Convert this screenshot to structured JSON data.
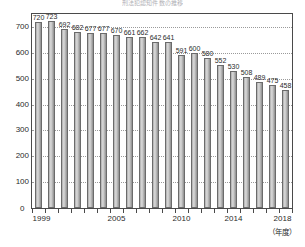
{
  "chart_data": {
    "type": "bar",
    "title": "刑法犯認知件数の推移",
    "xlabel": "（年度）",
    "ylabel": "",
    "categories": [
      "1999",
      "2000",
      "2001",
      "2002",
      "2003",
      "2004",
      "2005",
      "2006",
      "2007",
      "2008",
      "2009",
      "2010",
      "2011",
      "2012",
      "2013",
      "2014",
      "2015",
      "2016",
      "2017",
      "2018"
    ],
    "values": [
      720,
      723,
      692,
      682,
      677,
      677,
      670,
      661,
      662,
      642,
      641,
      591,
      600,
      580,
      552,
      530,
      508,
      489,
      475,
      458
    ],
    "ylim": [
      0,
      750
    ],
    "yticks": [
      0,
      100,
      200,
      300,
      400,
      500,
      600,
      700
    ],
    "ytick_labels": [
      "0",
      "100",
      "200",
      "300",
      "400",
      "500",
      "600",
      "700"
    ],
    "xtick_labels": [
      "1999",
      "2005",
      "2010",
      "2014",
      "2018"
    ],
    "xtick_categories": [
      "1999",
      "2005",
      "2010",
      "2014",
      "2018"
    ],
    "grid": true,
    "grid_axis": "y",
    "legend": false,
    "bar_fill": "#c9c9c9",
    "bar_border": "#6b6b6b",
    "axis_color": "#4a4a4a",
    "grid_color": "#9a9a9a",
    "text_color": "#2b2b2b"
  },
  "axis": {
    "origin_label": "0",
    "unit_label": "（年度）"
  }
}
